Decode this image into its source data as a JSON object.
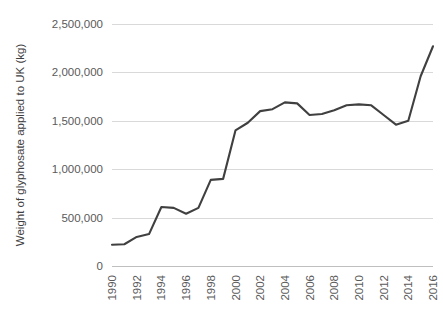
{
  "chart_data": {
    "type": "line",
    "title": "",
    "xlabel": "",
    "ylabel": "Weight of glyphosate applied to UK (kg)",
    "ylim": [
      0,
      2500000
    ],
    "xlim": [
      1990,
      2016
    ],
    "grid": true,
    "legend": false,
    "y_ticks": [
      0,
      500000,
      1000000,
      1500000,
      2000000,
      2500000
    ],
    "y_tick_labels": [
      "0",
      "500,000",
      "1,000,000",
      "1,500,000",
      "2,000,000",
      "2,500,000"
    ],
    "x_ticks": [
      1990,
      1992,
      1994,
      1996,
      1998,
      2000,
      2002,
      2004,
      2006,
      2008,
      2010,
      2012,
      2014,
      2016
    ],
    "x_tick_labels": [
      "1990",
      "1992",
      "1994",
      "1996",
      "1998",
      "2000",
      "2002",
      "2004",
      "2006",
      "2008",
      "2010",
      "2012",
      "2014",
      "2016"
    ],
    "x": [
      1990,
      1991,
      1992,
      1993,
      1994,
      1995,
      1996,
      1997,
      1998,
      1999,
      2000,
      2001,
      2002,
      2003,
      2004,
      2005,
      2006,
      2007,
      2008,
      2009,
      2010,
      2011,
      2012,
      2013,
      2014,
      2015,
      2016
    ],
    "values": [
      220000,
      225000,
      300000,
      330000,
      610000,
      600000,
      540000,
      600000,
      890000,
      900000,
      1400000,
      1480000,
      1600000,
      1620000,
      1690000,
      1680000,
      1560000,
      1570000,
      1610000,
      1660000,
      1670000,
      1660000,
      1560000,
      1460000,
      1500000,
      1960000,
      2270000
    ],
    "series_color": "#404040",
    "grid_color": "#d9d9d9",
    "axis_color": "#bfbfbf",
    "tick_label_color": "#5a5a5a",
    "axis_title_color": "#3f3f3f",
    "background_color": "#ffffff"
  }
}
